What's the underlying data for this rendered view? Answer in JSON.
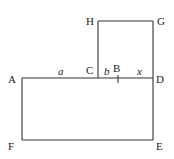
{
  "diagram": {
    "type": "geometry-figure",
    "points": {
      "A": {
        "label": "A",
        "x": 22,
        "y": 78
      },
      "C": {
        "label": "C",
        "x": 98,
        "y": 78
      },
      "B": {
        "label": "B",
        "x": 118,
        "y": 78
      },
      "D": {
        "label": "D",
        "x": 153,
        "y": 78
      },
      "H": {
        "label": "H",
        "x": 98,
        "y": 21
      },
      "G": {
        "label": "G",
        "x": 153,
        "y": 21
      },
      "F": {
        "label": "F",
        "x": 22,
        "y": 140
      },
      "E": {
        "label": "E",
        "x": 153,
        "y": 140
      }
    },
    "segment_labels": {
      "a": "a",
      "b": "b",
      "x": "x"
    },
    "colors": {
      "line": "#333333",
      "text": "#222222",
      "background": "#ffffff"
    }
  }
}
